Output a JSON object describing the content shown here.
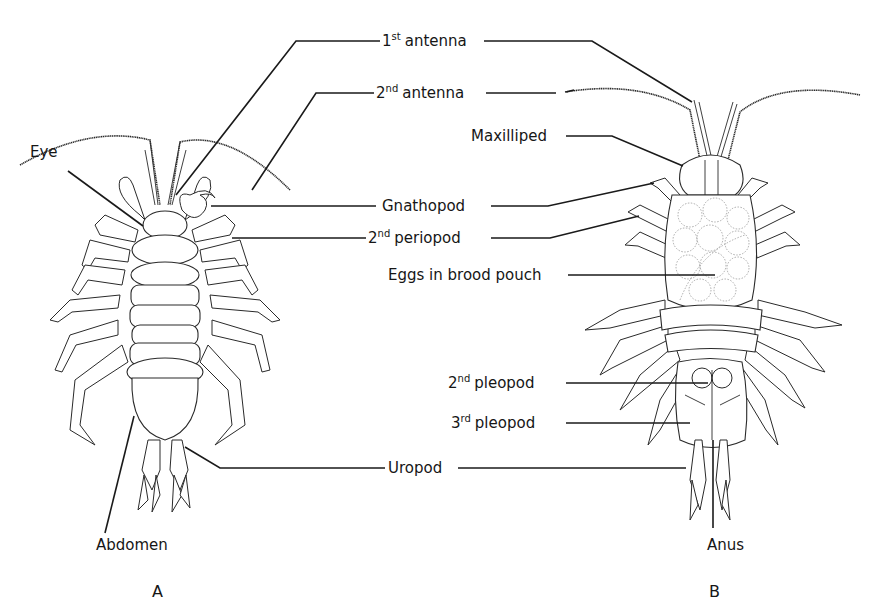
{
  "figure": {
    "type": "labeled anatomical diagram",
    "panels": [
      {
        "id": "A",
        "label": "A",
        "view": "dorsal"
      },
      {
        "id": "B",
        "label": "B",
        "view": "ventral (female with brood pouch)"
      }
    ],
    "labels": {
      "first_antenna": {
        "base": "1",
        "sup": "st",
        "text": "antenna"
      },
      "second_antenna": {
        "base": "2",
        "sup": "nd",
        "text": "antenna"
      },
      "eye": {
        "text": "Eye"
      },
      "maxilliped": {
        "text": "Maxilliped"
      },
      "gnathopod": {
        "text": "Gnathopod"
      },
      "second_periopod": {
        "base": "2",
        "sup": "nd",
        "text": "periopod"
      },
      "eggs": {
        "text": "Eggs in brood pouch"
      },
      "second_pleopod": {
        "base": "2",
        "sup": "nd",
        "text": "pleopod"
      },
      "third_pleopod": {
        "base": "3",
        "sup": "rd",
        "text": "pleopod"
      },
      "uropod": {
        "text": "Uropod"
      },
      "abdomen": {
        "text": "Abdomen"
      },
      "anus": {
        "text": "Anus"
      }
    }
  }
}
